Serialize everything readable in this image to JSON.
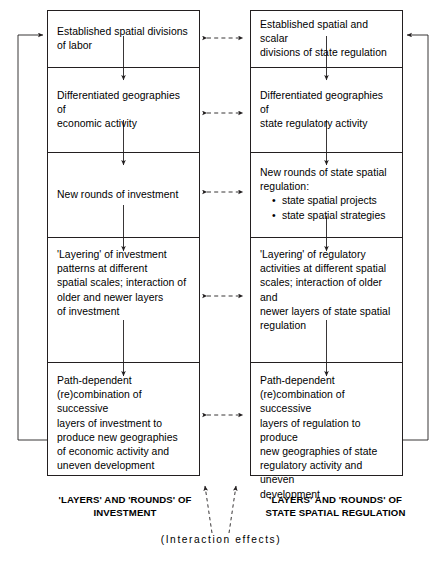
{
  "figure": {
    "columns": [
      {
        "id": "investment",
        "caption": "'LAYERS' AND 'ROUNDS' OF\nINVESTMENT",
        "cells": [
          {
            "text": "Established spatial divisions\nof labor"
          },
          {
            "text": "Differentiated geographies of\neconomic activity"
          },
          {
            "text": "New rounds of investment"
          },
          {
            "text": "'Layering' of investment\npatterns at different\nspatial scales; interaction of\nolder and newer layers\nof investment"
          },
          {
            "text": "Path-dependent\n(re)combination of successive\nlayers of investment to\nproduce new geographies\nof economic activity and\nuneven development"
          }
        ]
      },
      {
        "id": "state-regulation",
        "caption": "'LAYERS' AND 'ROUNDS' OF\nSTATE SPATIAL REGULATION",
        "cells": [
          {
            "text": "Established spatial and scalar\ndivisions of state regulation"
          },
          {
            "text": "Differentiated geographies of\nstate regulatory activity"
          },
          {
            "text": "New rounds of state spatial\nregulation:",
            "bullets": [
              "state spatial projects",
              "state spatial strategies"
            ]
          },
          {
            "text": "'Layering' of regulatory\nactivities at different spatial\nscales; interaction of older and\nnewer layers of state spatial\nregulation"
          },
          {
            "text": "Path-dependent\n(re)combination of successive\nlayers of regulation to produce\nnew geographies of state\nregulatory activity and uneven\ndevelopment"
          }
        ]
      }
    ],
    "interaction_label": "(Interaction effects)",
    "colors": {
      "line": "#231f20",
      "text": "#000000",
      "background": "#ffffff"
    }
  }
}
